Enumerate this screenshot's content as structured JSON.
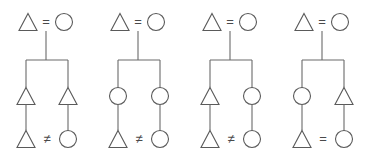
{
  "figure": {
    "title": "",
    "background_color": "#ffffff",
    "stroke_color": "#5a5a5a",
    "panel_count": 4,
    "shape_glyphs": {
      "triangle": "triangle",
      "circle": "circle"
    },
    "relation_glyphs": {
      "equal": "=",
      "not_equal": "≠"
    }
  },
  "panels": [
    {
      "id": "panel-1",
      "x": 0,
      "top_row": {
        "left_shape": "triangle",
        "relation": "=",
        "right_shape": "circle"
      },
      "middle_row": {
        "left_shape": "triangle",
        "right_shape": "triangle"
      },
      "bottom_row": {
        "left_shape": "triangle",
        "relation": "≠",
        "right_shape": "circle"
      }
    },
    {
      "id": "panel-2",
      "x": 92,
      "top_row": {
        "left_shape": "triangle",
        "relation": "=",
        "right_shape": "circle"
      },
      "middle_row": {
        "left_shape": "circle",
        "right_shape": "circle"
      },
      "bottom_row": {
        "left_shape": "triangle",
        "relation": "≠",
        "right_shape": "circle"
      }
    },
    {
      "id": "panel-3",
      "x": 184,
      "top_row": {
        "left_shape": "triangle",
        "relation": "=",
        "right_shape": "circle"
      },
      "middle_row": {
        "left_shape": "triangle",
        "right_shape": "circle"
      },
      "bottom_row": {
        "left_shape": "triangle",
        "relation": "≠",
        "right_shape": "circle"
      }
    },
    {
      "id": "panel-4",
      "x": 276,
      "top_row": {
        "left_shape": "circle",
        "relation": "=",
        "right_shape": "triangle"
      },
      "middle_row": {
        "left_shape": "circle",
        "right_shape": "triangle"
      },
      "bottom_row": {
        "left_shape": "triangle",
        "relation": "=",
        "right_shape": "circle"
      }
    }
  ],
  "panel_overrides": {
    "panel-4": {
      "top_row": {
        "left_shape": "triangle",
        "relation": "=",
        "right_shape": "circle"
      }
    }
  }
}
